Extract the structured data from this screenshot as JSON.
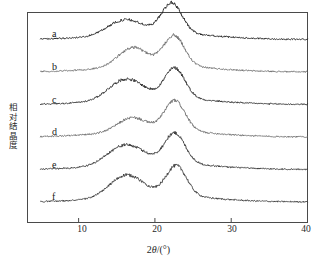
{
  "chart_data": {
    "type": "line",
    "title": "",
    "xlabel": "2θ/(°)",
    "ylabel": "相对结晶度",
    "xlim": [
      3.3,
      40
    ],
    "ylim": [
      0,
      6
    ],
    "xticks": [
      10,
      20,
      30,
      40
    ],
    "xtick_labels": [
      "10",
      "20",
      "30",
      "40"
    ],
    "yticks": [],
    "ytick_labels": [],
    "grid": false,
    "legend": "none",
    "frame": true,
    "note": "Stacked XRD diffractograms, six offset traces labelled a-f from top to bottom",
    "series": [
      {
        "name": "a",
        "label": "a",
        "color": "#1c1c1c",
        "offset_index": 0,
        "peaks": [
          {
            "two_theta": 15.1,
            "relative_height": 0.3
          },
          {
            "two_theta": 17.2,
            "relative_height": 0.26
          },
          {
            "two_theta": 22.2,
            "relative_height": 1.0
          }
        ],
        "baseline": 0.02
      },
      {
        "name": "b",
        "label": "b",
        "color": "#6d6d6d",
        "offset_index": 1,
        "peaks": [
          {
            "two_theta": 17.1,
            "relative_height": 0.62
          },
          {
            "two_theta": 22.5,
            "relative_height": 1.0
          }
        ],
        "baseline": 0.02
      },
      {
        "name": "c",
        "label": "c",
        "color": "#2a2a2a",
        "offset_index": 2,
        "peaks": [
          {
            "two_theta": 15.2,
            "relative_height": 0.4
          },
          {
            "two_theta": 17.3,
            "relative_height": 0.38
          },
          {
            "two_theta": 22.6,
            "relative_height": 1.0
          }
        ],
        "baseline": 0.02
      },
      {
        "name": "d",
        "label": "d",
        "color": "#6a6a6a",
        "offset_index": 3,
        "peaks": [
          {
            "two_theta": 17.0,
            "relative_height": 0.45
          },
          {
            "two_theta": 22.6,
            "relative_height": 1.0
          }
        ],
        "baseline": 0.02
      },
      {
        "name": "e",
        "label": "e",
        "color": "#333333",
        "offset_index": 4,
        "peaks": [
          {
            "two_theta": 15.0,
            "relative_height": 0.4
          },
          {
            "two_theta": 17.4,
            "relative_height": 0.38
          },
          {
            "two_theta": 22.6,
            "relative_height": 1.0
          }
        ],
        "baseline": 0.02
      },
      {
        "name": "f",
        "label": "f",
        "color": "#3a3a3a",
        "offset_index": 5,
        "peaks": [
          {
            "two_theta": 15.3,
            "relative_height": 0.42
          },
          {
            "two_theta": 17.3,
            "relative_height": 0.4
          },
          {
            "two_theta": 22.8,
            "relative_height": 1.0
          }
        ],
        "baseline": 0.02
      }
    ],
    "curve_labels": [
      "a",
      "b",
      "c",
      "d",
      "e",
      "f"
    ]
  },
  "axes": {
    "x_tick_10": "10",
    "x_tick_20": "20",
    "x_tick_30": "30",
    "x_tick_40": "40",
    "x_axis_title_pre": "2",
    "x_axis_title_theta": "θ",
    "x_axis_title_post": "/(°)",
    "y_axis_title": "相对结晶度"
  },
  "curve_labels": {
    "a": "a",
    "b": "b",
    "c": "c",
    "d": "d",
    "e": "e",
    "f": "f"
  }
}
